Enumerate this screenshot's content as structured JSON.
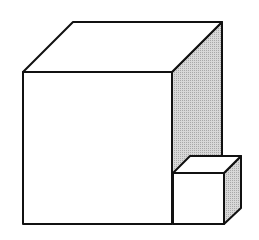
{
  "diagram": {
    "title": "",
    "colors": {
      "stroke": "#111111",
      "face": "#ffffff",
      "shade": "#cfcfcf"
    },
    "shapes": [
      {
        "id": "large-cube",
        "label": ""
      },
      {
        "id": "small-cube",
        "label": ""
      }
    ]
  }
}
